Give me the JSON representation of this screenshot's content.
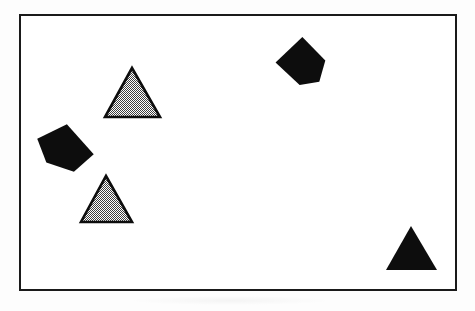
{
  "figure": {
    "canvas": {
      "width": 475,
      "height": 311,
      "background": "#fdfdfd"
    },
    "frame": {
      "name": "bounding-rectangle",
      "x": 19,
      "y": 14,
      "width": 438,
      "height": 277,
      "border_width": 2,
      "border_color": "#1a1a1a",
      "fill": "#ffffff"
    },
    "palette": {
      "black": "#0d0d0d",
      "gray_stipple_light": "#ffffff",
      "gray_stipple_dark": "#4a4a4a",
      "outline": "#0d0d0d",
      "canvas": "#fdfdfd"
    },
    "shape_count": 5,
    "shapes": [
      {
        "id": "triangle-gray-upper",
        "kind": "triangle",
        "fill": "gray-stipple",
        "label": "gray stippled triangle, upper left",
        "points": "132,68 160,117 105,117",
        "bbox": {
          "x": 105,
          "y": 68,
          "width": 55,
          "height": 49
        },
        "stroke": "#0d0d0d",
        "stroke_width": 2.6,
        "rotation_deg": 0
      },
      {
        "id": "triangle-gray-lower",
        "kind": "triangle",
        "fill": "gray-stipple",
        "label": "gray stippled triangle, lower left",
        "points": "106,176 132,222 81,222",
        "bbox": {
          "x": 81,
          "y": 176,
          "width": 51,
          "height": 46
        },
        "stroke": "#0d0d0d",
        "stroke_width": 2.6,
        "rotation_deg": 0
      },
      {
        "id": "pentagon-black-left",
        "kind": "pentagon",
        "fill": "black",
        "label": "black pentagon, left middle",
        "points": "72,125 92,160 69,173 44,158 40,133",
        "bbox": {
          "x": 40,
          "y": 125,
          "width": 52,
          "height": 48
        },
        "stroke": "none",
        "stroke_width": 0,
        "rotation_deg": -12
      },
      {
        "id": "pentagon-black-top",
        "kind": "pentagon",
        "fill": "black",
        "label": "black pentagon, top right",
        "points": "299,37 325,57 322,79 303,85 276,66",
        "bbox": {
          "x": 276,
          "y": 37,
          "width": 49,
          "height": 48
        },
        "stroke": "none",
        "stroke_width": 0,
        "rotation_deg": 8
      },
      {
        "id": "triangle-black-lower-right",
        "kind": "triangle",
        "fill": "black",
        "label": "black triangle, bottom right",
        "points": "411,226 437,270 386,270",
        "bbox": {
          "x": 386,
          "y": 226,
          "width": 51,
          "height": 44
        },
        "stroke": "none",
        "stroke_width": 0,
        "rotation_deg": 0
      }
    ]
  }
}
